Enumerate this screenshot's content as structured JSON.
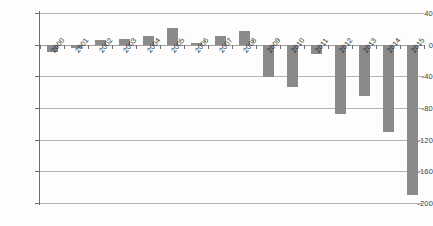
{
  "chart_data": {
    "type": "bar",
    "title": "",
    "subtitle": "",
    "xlabel": "",
    "ylabel": "",
    "categories": [
      "2000",
      "2001",
      "2002",
      "2003",
      "2004",
      "2005",
      "2006",
      "2007",
      "2008",
      "2009",
      "2010",
      "2011",
      "2012",
      "2013",
      "2014",
      "2015"
    ],
    "values": [
      -9,
      -4,
      6,
      7,
      11,
      21,
      2,
      11,
      17,
      -41,
      -53,
      -12,
      -87,
      -65,
      -110,
      -190
    ],
    "series": [
      {
        "name": "",
        "values": [
          -9,
          -4,
          6,
          7,
          11,
          21,
          2,
          11,
          17,
          -41,
          -53,
          -12,
          -87,
          -65,
          -110,
          -190
        ]
      }
    ],
    "ylim": [
      -200,
      40
    ],
    "ytick_values": [
      40,
      0,
      -40,
      -80,
      -120,
      -160,
      -200
    ],
    "ytick_labels": [
      "40",
      "0",
      "-40",
      "-80",
      "-120",
      "-160",
      "-200"
    ],
    "grid": true,
    "legend": "none",
    "bar_color": "#8a8a8a",
    "gridline_color": "#b4b4b4",
    "axis_color": "#6e6e6e",
    "background_color": "#ffffff"
  }
}
